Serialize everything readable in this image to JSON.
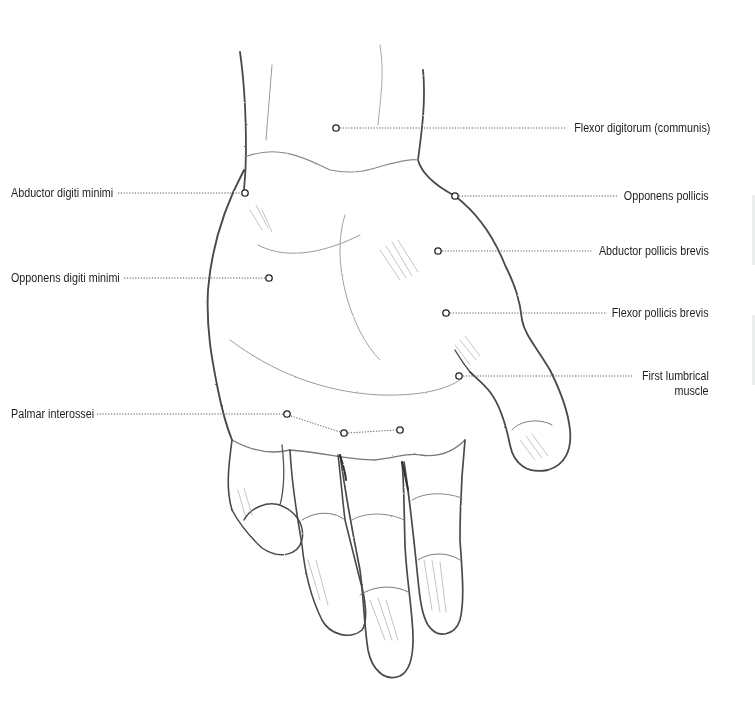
{
  "diagram": {
    "colors": {
      "background": "#ffffff",
      "text": "#1e1e1e",
      "leader": "#555555",
      "pencil": "#4a4a4a"
    },
    "labels": [
      {
        "id": "flexor-digitorum",
        "text": "Flexor digitorum (communis)",
        "side": "right",
        "point": [
          336,
          128
        ]
      },
      {
        "id": "abductor-digiti-minimi",
        "text": "Abductor digiti minimi",
        "side": "left",
        "point": [
          245,
          193
        ]
      },
      {
        "id": "opponens-pollicis",
        "text": "Opponens pollicis",
        "side": "right",
        "point": [
          455,
          196
        ]
      },
      {
        "id": "abductor-pollicis-brevis",
        "text": "Abductor pollicis brevis",
        "side": "right",
        "point": [
          438,
          251
        ]
      },
      {
        "id": "opponens-digiti-minimi",
        "text": "Opponens digiti minimi",
        "side": "left",
        "point": [
          269,
          278
        ]
      },
      {
        "id": "flexor-pollicis-brevis",
        "text": "Flexor pollicis brevis",
        "side": "right",
        "point": [
          446,
          313
        ]
      },
      {
        "id": "first-lumbrical",
        "text": "First lumbrical",
        "text2": "muscle",
        "side": "right",
        "point": [
          459,
          376
        ]
      },
      {
        "id": "palmar-interossei",
        "text": "Palmar interossei",
        "side": "left",
        "point": [
          287,
          414
        ],
        "extra_points": [
          [
            344,
            433
          ],
          [
            400,
            430
          ]
        ]
      }
    ]
  }
}
